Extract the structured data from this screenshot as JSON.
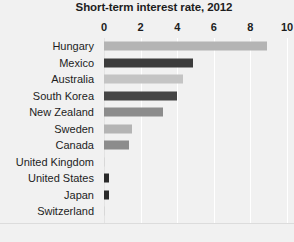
{
  "chart_data": {
    "type": "bar",
    "orientation": "horizontal",
    "title": "Short-term interest rate, 2012",
    "xlabel": "",
    "ylabel": "",
    "xlim": [
      0,
      10
    ],
    "xticks": [
      0,
      2,
      4,
      6,
      8,
      10
    ],
    "xtick_labels": [
      "0",
      "2",
      "4",
      "6",
      "8",
      "10"
    ],
    "grid": true,
    "grid_color": "#ffffff",
    "legend": "none",
    "background_color": "#f1f1f1",
    "text_color": "#1d1d1d",
    "categories": [
      "Hungary",
      "Mexico",
      "Australia",
      "South Korea",
      "New Zealand",
      "Sweden",
      "Canada",
      "United Kingdom",
      "United States",
      "Japan",
      "Switzerland"
    ],
    "values": [
      8.9,
      4.85,
      4.3,
      4.0,
      3.2,
      1.55,
      1.35,
      0.05,
      0.25,
      0.25,
      0.02
    ],
    "bar_colors": [
      "#b4b4b4",
      "#3c3c3c",
      "#c4c4c4",
      "#454545",
      "#8c8c8c",
      "#b4b4b4",
      "#8c8c8c",
      "#d8d8d8",
      "#2a2a2a",
      "#2a2a2a",
      "#d8d8d8"
    ]
  }
}
